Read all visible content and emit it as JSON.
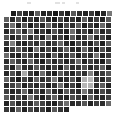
{
  "figure": {
    "title": "",
    "background_color": "#ffffff",
    "grid_line_color": "#ffffff"
  },
  "header_marks": [
    {
      "left": 27,
      "width": 4
    },
    {
      "left": 55,
      "width": 5
    },
    {
      "left": 62,
      "width": 3
    },
    {
      "left": 76,
      "width": 3
    }
  ],
  "chart_data": {
    "type": "heatmap",
    "title": "",
    "xlabel": "",
    "ylabel": "",
    "colormap": "gray",
    "vmin": 0,
    "vmax": 255,
    "grid": true,
    "legend": null,
    "xtick_labels": [],
    "ytick_labels": [],
    "n_rows": 17,
    "n_cols": 18,
    "cell_size_px": 6,
    "row_offsets_px": [
      7,
      0,
      0,
      0,
      0,
      0,
      0,
      0,
      0,
      0,
      0,
      0,
      0,
      0,
      0,
      0,
      0
    ],
    "row_lengths": [
      17,
      18,
      18,
      18,
      18,
      18,
      18,
      18,
      18,
      18,
      18,
      18,
      18,
      18,
      18,
      18,
      11
    ],
    "values": [
      [
        28,
        64,
        40,
        30,
        92,
        36,
        44,
        24,
        52,
        30,
        88,
        46,
        34,
        58,
        26,
        38,
        120
      ],
      [
        96,
        40,
        78,
        30,
        58,
        34,
        86,
        44,
        28,
        70,
        36,
        52,
        30,
        96,
        40,
        62,
        34,
        88
      ],
      [
        60,
        112,
        36,
        88,
        30,
        66,
        40,
        100,
        52,
        34,
        78,
        44,
        92,
        30,
        58,
        36,
        104,
        46
      ],
      [
        40,
        72,
        100,
        44,
        120,
        34,
        58,
        30,
        86,
        48,
        36,
        110,
        42,
        66,
        30,
        94,
        38,
        60
      ],
      [
        84,
        36,
        58,
        96,
        40,
        78,
        32,
        108,
        44,
        62,
        30,
        88,
        36,
        52,
        116,
        40,
        70,
        34
      ],
      [
        52,
        128,
        44,
        34,
        66,
        46,
        90,
        38,
        60,
        104,
        42,
        30,
        74,
        48,
        36,
        82,
        30,
        96
      ],
      [
        36,
        60,
        88,
        52,
        30,
        112,
        40,
        72,
        34,
        58,
        96,
        44,
        38,
        102,
        50,
        32,
        78,
        42
      ],
      [
        108,
        44,
        32,
        80,
        56,
        38,
        66,
        30,
        94,
        40,
        52,
        86,
        34,
        62,
        44,
        118,
        36,
        58
      ],
      [
        46,
        96,
        60,
        36,
        104,
        48,
        30,
        82,
        42,
        74,
        38,
        56,
        110,
        34,
        68,
        44,
        30,
        90
      ],
      [
        70,
        34,
        116,
        48,
        40,
        88,
        58,
        36,
        66,
        30,
        100,
        46,
        52,
        78,
        38,
        60,
        96,
        32
      ],
      [
        38,
        80,
        42,
        170,
        62,
        34,
        108,
        44,
        30,
        92,
        54,
        36,
        70,
        48,
        128,
        40,
        58,
        86
      ],
      [
        100,
        52,
        30,
        68,
        38,
        96,
        46,
        60,
        120,
        36,
        44,
        84,
        32,
        176,
        186,
        58,
        40,
        72
      ],
      [
        44,
        66,
        90,
        36,
        58,
        42,
        76,
        30,
        52,
        110,
        38,
        64,
        28,
        182,
        178,
        46,
        94,
        36
      ],
      [
        62,
        38,
        50,
        104,
        34,
        70,
        40,
        96,
        46,
        32,
        88,
        56,
        42,
        120,
        60,
        36,
        74,
        50
      ],
      [
        90,
        46,
        72,
        40,
        118,
        52,
        34,
        62,
        100,
        44,
        36,
        78,
        58,
        30,
        96,
        48,
        42,
        66
      ],
      [
        34,
        84,
        38,
        56,
        44,
        92,
        66,
        38,
        30,
        72,
        110,
        40,
        50,
        86,
        34,
        62,
        44,
        104
      ],
      [
        56,
        40,
        98,
        34,
        70,
        46,
        62,
        30,
        88,
        52,
        36
      ]
    ]
  }
}
